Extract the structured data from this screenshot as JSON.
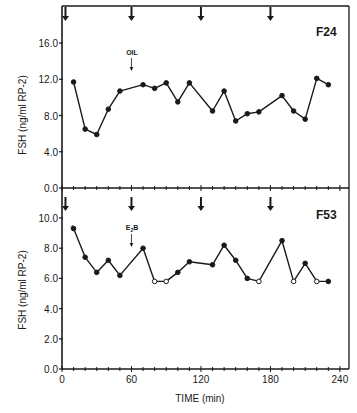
{
  "chart_data": [
    {
      "type": "line",
      "panel": "F24",
      "title": "F24",
      "xlabel": "TIME (min)",
      "ylabel": "FSH (ng/ml RP-2)",
      "xlim": [
        0,
        247
      ],
      "ylim": [
        0,
        19.9
      ],
      "yticks": [
        0.0,
        4.0,
        8.0,
        12.0,
        16.0
      ],
      "ytick_labels": [
        "0.0",
        "4.0",
        "8.0",
        "12.0",
        "16.0"
      ],
      "xticks_minor_step": 10,
      "grid": false,
      "arrows_at": [
        3,
        60,
        120,
        180
      ],
      "annotations": [
        {
          "text": "OIL",
          "x": 60,
          "note": "small arrow below label"
        }
      ],
      "series": [
        {
          "name": "F24 FSH",
          "x": [
            10,
            20,
            30,
            40,
            50,
            70,
            80,
            90,
            100,
            110,
            130,
            140,
            150,
            160,
            170,
            190,
            200,
            210,
            220,
            230
          ],
          "values": [
            11.7,
            6.5,
            5.9,
            8.7,
            10.7,
            11.4,
            11.0,
            11.6,
            9.5,
            11.6,
            8.5,
            10.7,
            7.4,
            8.2,
            8.4,
            10.2,
            8.5,
            7.6,
            12.1,
            11.4
          ],
          "marker": [
            "filled",
            "filled",
            "filled",
            "filled",
            "filled",
            "filled",
            "filled",
            "filled",
            "filled",
            "filled",
            "filled",
            "filled",
            "filled",
            "filled",
            "filled",
            "filled",
            "filled",
            "filled",
            "filled",
            "filled"
          ]
        }
      ]
    },
    {
      "type": "line",
      "panel": "F53",
      "title": "F53",
      "xlabel": "TIME (min)",
      "ylabel": "FSH (ng/ml RP-2)",
      "xlim": [
        0,
        247
      ],
      "ylim": [
        0,
        11.8
      ],
      "yticks": [
        0.0,
        2.0,
        4.0,
        6.0,
        8.0,
        10.0
      ],
      "ytick_labels": [
        "0.0",
        "2.0",
        "4.0",
        "6.0",
        "8.0",
        "10.0"
      ],
      "xticks": [
        0,
        60,
        120,
        180,
        240
      ],
      "xtick_labels": [
        "0",
        "60",
        "120",
        "180",
        "240"
      ],
      "xticks_minor_step": 10,
      "grid": false,
      "arrows_at": [
        3,
        60,
        120,
        180
      ],
      "annotations": [
        {
          "text": "E2B",
          "x": 60,
          "note": "small arrow below label"
        },
        {
          "text": "*",
          "x": 10,
          "note": "asterisk above first point"
        }
      ],
      "series": [
        {
          "name": "F53 FSH",
          "x": [
            10,
            20,
            30,
            40,
            50,
            70,
            80,
            90,
            100,
            110,
            130,
            140,
            150,
            160,
            170,
            190,
            200,
            210,
            220,
            230
          ],
          "values": [
            9.3,
            7.4,
            6.4,
            7.2,
            6.2,
            8.0,
            5.8,
            5.8,
            6.4,
            7.1,
            6.9,
            8.2,
            7.2,
            6.0,
            5.8,
            8.5,
            5.8,
            7.0,
            5.8,
            5.8
          ],
          "marker": [
            "filled",
            "filled",
            "filled",
            "filled",
            "filled",
            "filled",
            "open",
            "open",
            "filled",
            "filled",
            "filled",
            "filled",
            "filled",
            "filled",
            "open",
            "filled",
            "open",
            "filled",
            "open",
            "filled"
          ]
        }
      ]
    }
  ],
  "labels": {
    "top_panel": "F24",
    "bottom_panel": "F53",
    "ylabel": "FSH (ng/ml RP-2)",
    "xlabel": "TIME (min)",
    "oil": "OIL",
    "e2b_main": "E",
    "e2b_sub": "2",
    "e2b_tail": "B",
    "asterisk": "*"
  },
  "colors": {
    "ink": "#1a1a1a",
    "background": "#ffffff"
  }
}
